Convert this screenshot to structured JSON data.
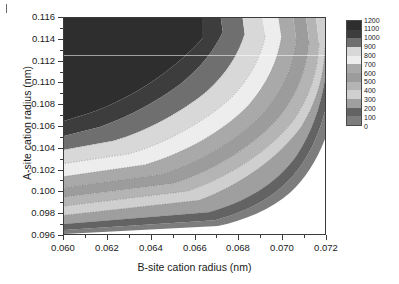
{
  "figure": {
    "background_color": "#ffffff",
    "frame_color": "#3b3b3b"
  },
  "chart_data": {
    "type": "heatmap",
    "subtype": "filled-contour",
    "title": "",
    "xlabel": "B-site cation radius (nm)",
    "ylabel": "A-site cation radius (nm)",
    "xlim": [
      0.06,
      0.072
    ],
    "ylim": [
      0.096,
      0.116
    ],
    "xticks": [
      0.06,
      0.062,
      0.064,
      0.066,
      0.068,
      0.07,
      0.072
    ],
    "xticklabels": [
      "0.060",
      "0.062",
      "0.064",
      "0.066",
      "0.068",
      "0.070",
      "0.072"
    ],
    "yticks": [
      0.096,
      0.098,
      0.1,
      0.102,
      0.104,
      0.106,
      0.108,
      0.11,
      0.112,
      0.114,
      0.116
    ],
    "yticklabels": [
      "0.096",
      "0.098",
      "0.100",
      "0.102",
      "0.104",
      "0.106",
      "0.108",
      "0.110",
      "0.112",
      "0.114",
      "0.116"
    ],
    "grid": false,
    "contour_levels": [
      0,
      100,
      200,
      300,
      400,
      500,
      600,
      700,
      800,
      900,
      1000,
      1100,
      1200
    ],
    "colorbar": {
      "position": "right",
      "vmin": 0,
      "vmax": 1200,
      "tick_labels": [
        "1200",
        "1100",
        "1000",
        "900",
        "800",
        "700",
        "600",
        "500",
        "400",
        "300",
        "200",
        "100",
        "0"
      ],
      "bands": [
        {
          "range": [
            1100,
            1200
          ],
          "color": "#2e2e2e"
        },
        {
          "range": [
            1000,
            1100
          ],
          "color": "#3d3d3d"
        },
        {
          "range": [
            900,
            1000
          ],
          "color": "#6f6f6f"
        },
        {
          "range": [
            800,
            900
          ],
          "color": "#d8d8d8"
        },
        {
          "range": [
            700,
            800
          ],
          "color": "#ededed"
        },
        {
          "range": [
            600,
            700
          ],
          "color": "#a9a9a9"
        },
        {
          "range": [
            500,
            600
          ],
          "color": "#9c9c9c"
        },
        {
          "range": [
            400,
            500
          ],
          "color": "#b4b4b4"
        },
        {
          "range": [
            300,
            400
          ],
          "color": "#cfcfcf"
        },
        {
          "range": [
            200,
            300
          ],
          "color": "#9f9f9f"
        },
        {
          "range": [
            100,
            200
          ],
          "color": "#636363"
        },
        {
          "range": [
            0,
            100
          ],
          "color": "#7d7d7d"
        }
      ]
    },
    "field_samples": [
      {
        "x": 0.06,
        "y": 0.116,
        "value": 1200
      },
      {
        "x": 0.06,
        "y": 0.106,
        "value": 1100
      },
      {
        "x": 0.06,
        "y": 0.104,
        "value": 900
      },
      {
        "x": 0.06,
        "y": 0.102,
        "value": 700
      },
      {
        "x": 0.06,
        "y": 0.1,
        "value": 500
      },
      {
        "x": 0.06,
        "y": 0.098,
        "value": 300
      },
      {
        "x": 0.06,
        "y": 0.096,
        "value": 200
      },
      {
        "x": 0.064,
        "y": 0.116,
        "value": 1200
      },
      {
        "x": 0.066,
        "y": 0.114,
        "value": 1100
      },
      {
        "x": 0.067,
        "y": 0.11,
        "value": 1000
      },
      {
        "x": 0.068,
        "y": 0.108,
        "value": 800
      },
      {
        "x": 0.069,
        "y": 0.104,
        "value": 500
      },
      {
        "x": 0.07,
        "y": 0.102,
        "value": 200
      },
      {
        "x": 0.07,
        "y": 0.1,
        "value": 100
      },
      {
        "x": 0.072,
        "y": 0.116,
        "value": 700
      },
      {
        "x": 0.072,
        "y": 0.11,
        "value": 300
      },
      {
        "x": 0.072,
        "y": 0.106,
        "value": 100
      },
      {
        "x": 0.072,
        "y": 0.1,
        "value": 0
      },
      {
        "x": 0.068,
        "y": 0.096,
        "value": 0
      }
    ]
  }
}
